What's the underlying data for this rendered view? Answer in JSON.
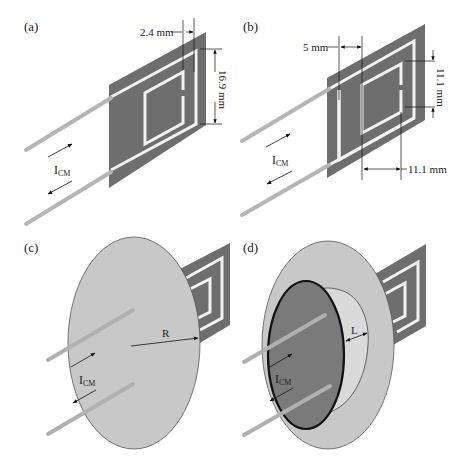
{
  "panels": [
    {
      "id": "a",
      "label": "(a)",
      "dims": [
        "2.4 mm",
        "16.9 mm"
      ],
      "current_label": "I",
      "current_sub": "CM"
    },
    {
      "id": "b",
      "label": "(b)",
      "dims": [
        "5 mm",
        "11.1 mm",
        "11.1 mm"
      ],
      "current_label": "I",
      "current_sub": "CM"
    },
    {
      "id": "c",
      "label": "(c)",
      "dims": [
        "R"
      ],
      "current_label": "I",
      "current_sub": "CM"
    },
    {
      "id": "d",
      "label": "(d)",
      "dims": [
        "L"
      ],
      "current_label": "I",
      "current_sub": "CM"
    }
  ],
  "colors": {
    "board": "#6e6e6e",
    "trace": "#f2f2f2",
    "wire": "#b5b5b5",
    "disk": "#c8c8c8",
    "inner_disk": "#dadada",
    "cap": "#7a7a7a",
    "line": "#111111"
  }
}
